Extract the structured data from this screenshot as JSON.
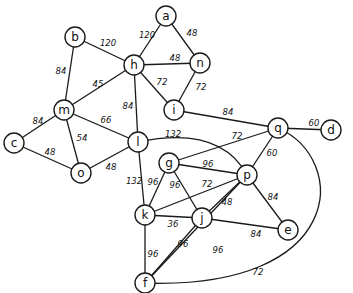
{
  "graph": {
    "type": "undirected-weighted",
    "nodes": [
      {
        "id": "a",
        "label": "a",
        "x": 166,
        "y": 16
      },
      {
        "id": "b",
        "label": "b",
        "x": 75,
        "y": 37
      },
      {
        "id": "h",
        "label": "h",
        "x": 134,
        "y": 65
      },
      {
        "id": "n",
        "label": "n",
        "x": 200,
        "y": 63
      },
      {
        "id": "i",
        "label": "i",
        "x": 174,
        "y": 110
      },
      {
        "id": "m",
        "label": "m",
        "x": 64,
        "y": 110
      },
      {
        "id": "c",
        "label": "c",
        "x": 14,
        "y": 143
      },
      {
        "id": "o",
        "label": "o",
        "x": 81,
        "y": 173
      },
      {
        "id": "l",
        "label": "l",
        "x": 138,
        "y": 142
      },
      {
        "id": "q",
        "label": "q",
        "x": 278,
        "y": 128
      },
      {
        "id": "d",
        "label": "d",
        "x": 331,
        "y": 130
      },
      {
        "id": "g",
        "label": "g",
        "x": 169,
        "y": 163
      },
      {
        "id": "p",
        "label": "p",
        "x": 247,
        "y": 175
      },
      {
        "id": "k",
        "label": "k",
        "x": 145,
        "y": 215
      },
      {
        "id": "j",
        "label": "j",
        "x": 202,
        "y": 218
      },
      {
        "id": "e",
        "label": "e",
        "x": 288,
        "y": 230
      },
      {
        "id": "f",
        "label": "f",
        "x": 145,
        "y": 283
      }
    ],
    "edges": [
      {
        "from": "a",
        "to": "h",
        "weight": "120",
        "lx": 147,
        "ly": 35
      },
      {
        "from": "a",
        "to": "n",
        "weight": "48",
        "lx": 192,
        "ly": 33
      },
      {
        "from": "h",
        "to": "n",
        "weight": "48",
        "lx": 175,
        "ly": 58
      },
      {
        "from": "h",
        "to": "i",
        "weight": "72",
        "lx": 162,
        "ly": 82
      },
      {
        "from": "n",
        "to": "i",
        "weight": "72",
        "lx": 201,
        "ly": 87
      },
      {
        "from": "b",
        "to": "h",
        "weight": "120",
        "lx": 108,
        "ly": 43
      },
      {
        "from": "b",
        "to": "m",
        "weight": "84",
        "lx": 61,
        "ly": 71
      },
      {
        "from": "m",
        "to": "h",
        "weight": "45",
        "lx": 98,
        "ly": 84
      },
      {
        "from": "h",
        "to": "l",
        "weight": "84",
        "lx": 128,
        "ly": 106
      },
      {
        "from": "m",
        "to": "l",
        "weight": "66",
        "lx": 106,
        "ly": 120
      },
      {
        "from": "m",
        "to": "c",
        "weight": "84",
        "lx": 38,
        "ly": 121
      },
      {
        "from": "m",
        "to": "o",
        "weight": "54",
        "lx": 82,
        "ly": 138
      },
      {
        "from": "c",
        "to": "o",
        "weight": "48",
        "lx": 50,
        "ly": 152
      },
      {
        "from": "o",
        "to": "l",
        "weight": "48",
        "lx": 111,
        "ly": 167
      },
      {
        "from": "l",
        "to": "p",
        "weight": "132",
        "lx": 173,
        "ly": 134,
        "curve": "M 138 142 Q 220 125 247 175"
      },
      {
        "from": "l",
        "to": "k",
        "weight": "132",
        "lx": 134,
        "ly": 181
      },
      {
        "from": "i",
        "to": "q",
        "weight": "84",
        "lx": 228,
        "ly": 112
      },
      {
        "from": "q",
        "to": "d",
        "weight": "60",
        "lx": 314,
        "ly": 123
      },
      {
        "from": "q",
        "to": "g",
        "weight": "72",
        "lx": 237,
        "ly": 136
      },
      {
        "from": "q",
        "to": "p",
        "weight": "60",
        "lx": 272,
        "ly": 153
      },
      {
        "from": "q",
        "to": "f",
        "weight": "72",
        "lx": 258,
        "ly": 272,
        "curve": "M 278 128 C 350 160 345 290 145 283"
      },
      {
        "from": "g",
        "to": "p",
        "weight": "96",
        "lx": 208,
        "ly": 164
      },
      {
        "from": "g",
        "to": "k",
        "weight": "96",
        "lx": 153,
        "ly": 182
      },
      {
        "from": "g",
        "to": "j",
        "weight": "96",
        "lx": 175,
        "ly": 185
      },
      {
        "from": "k",
        "to": "p",
        "weight": "72",
        "lx": 207,
        "ly": 184
      },
      {
        "from": "k",
        "to": "j",
        "weight": "36",
        "lx": 173,
        "ly": 224
      },
      {
        "from": "k",
        "to": "f",
        "weight": "96",
        "lx": 153,
        "ly": 254
      },
      {
        "from": "j",
        "to": "p",
        "weight": "48",
        "lx": 227,
        "ly": 202
      },
      {
        "from": "j",
        "to": "e",
        "weight": "84",
        "lx": 256,
        "ly": 234
      },
      {
        "from": "j",
        "to": "f",
        "weight": "96",
        "lx": 183,
        "ly": 244
      },
      {
        "from": "p",
        "to": "e",
        "weight": "84",
        "lx": 273,
        "ly": 197
      },
      {
        "from": "p",
        "to": "f",
        "weight": "96",
        "lx": 218,
        "ly": 250
      }
    ]
  }
}
